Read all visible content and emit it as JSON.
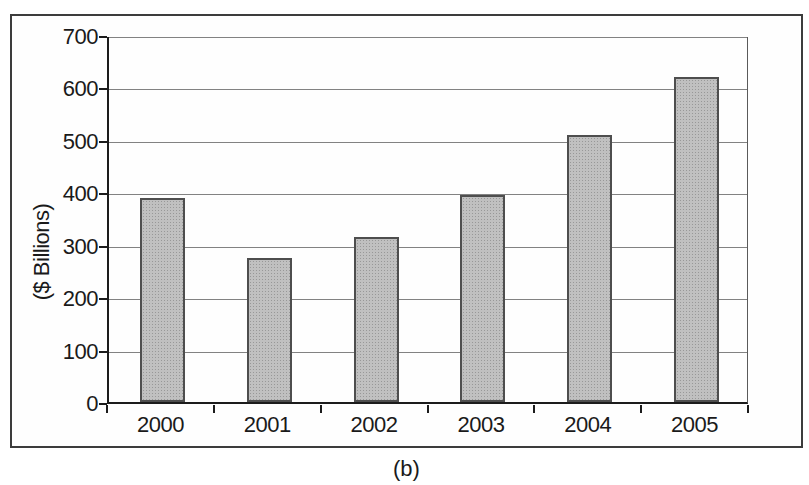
{
  "caption": "(b)",
  "colors": {
    "bar_fill": "#c0c0c0",
    "bar_dot": "#989898",
    "bar_border": "#4e4e4e",
    "gridline": "#828282",
    "axis": "#1c1c1c",
    "frame_border": "#3c3c3c",
    "background": "#ffffff"
  },
  "chart_data": {
    "type": "bar",
    "categories": [
      "2000",
      "2001",
      "2002",
      "2003",
      "2004",
      "2005"
    ],
    "values": [
      390,
      275,
      315,
      395,
      510,
      620
    ],
    "title": "",
    "xlabel": "",
    "ylabel": "($ Billions)",
    "ylim": [
      0,
      700
    ],
    "yticks": [
      0,
      100,
      200,
      300,
      400,
      500,
      600,
      700
    ],
    "ytick_step": 100,
    "grid": "horizontal",
    "legend_position": "none",
    "caption": "(b)"
  }
}
